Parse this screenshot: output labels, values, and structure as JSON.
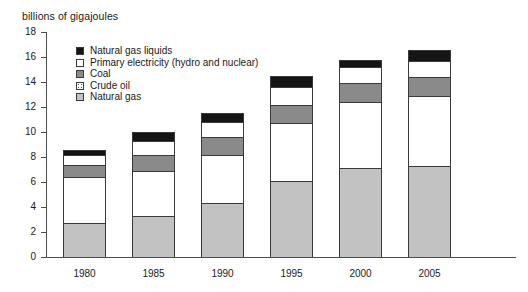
{
  "chart_data": {
    "type": "bar",
    "title": "",
    "subtitle": "",
    "ylabel": "billions of gigajoules",
    "xlabel": "",
    "ylim": [
      0,
      18
    ],
    "ytick_step": 2,
    "yticks": [
      "0",
      "2",
      "4",
      "6",
      "8",
      "10",
      "12",
      "14",
      "16",
      "18"
    ],
    "grid": false,
    "stacked": true,
    "legend_position": "inside-top-left",
    "categories": [
      "1980",
      "1985",
      "1990",
      "1995",
      "2000",
      "2005"
    ],
    "series": [
      {
        "name": "Natural gas",
        "key": "natural-gas",
        "color": "#c2c2c2",
        "swatch": "light-gray",
        "values": [
          2.7,
          3.3,
          4.3,
          6.1,
          7.1,
          7.3
        ]
      },
      {
        "name": "Crude oil",
        "key": "crude-oil",
        "color": "#ffffff",
        "swatch": "dotted-white",
        "values": [
          3.7,
          3.6,
          3.9,
          4.6,
          5.3,
          5.6
        ]
      },
      {
        "name": "Coal",
        "key": "coal",
        "color": "#8a8a8a",
        "swatch": "dark-gray",
        "values": [
          1.0,
          1.3,
          1.4,
          1.5,
          1.5,
          1.5
        ]
      },
      {
        "name": "Primary electricity (hydro and nuclear)",
        "key": "primary-electricity",
        "color": "#ffffff",
        "swatch": "white",
        "values": [
          0.8,
          1.1,
          1.2,
          1.4,
          1.3,
          1.3
        ]
      },
      {
        "name": "Natural gas liquids",
        "key": "natural-gas-liquids",
        "color": "#151515",
        "swatch": "black",
        "values": [
          0.4,
          0.7,
          0.7,
          0.9,
          0.6,
          0.9
        ]
      }
    ],
    "totals": [
      8.6,
      10.0,
      11.5,
      14.5,
      15.8,
      16.6
    ]
  },
  "legend": {
    "items": [
      {
        "label": "Natural gas liquids",
        "swatch": "black"
      },
      {
        "label": "Primary electricity (hydro and nuclear)",
        "swatch": "white"
      },
      {
        "label": "Coal",
        "swatch": "dark-gray"
      },
      {
        "label": "Crude oil",
        "swatch": "dotted-white"
      },
      {
        "label": "Natural gas",
        "swatch": "light-gray"
      }
    ]
  },
  "axis": {
    "y_title": "billions of gigajoules",
    "y_ticks": [
      "18",
      "16",
      "14",
      "12",
      "10",
      "8",
      "6",
      "4",
      "2",
      "0"
    ],
    "x_ticks": [
      "1980",
      "1985",
      "1990",
      "1995",
      "2000",
      "2005"
    ]
  },
  "colors": {
    "natural_gas": "#c2c2c2",
    "crude_oil": "#ffffff",
    "coal": "#8a8a8a",
    "primary_electricity": "#ffffff",
    "natural_gas_liquids": "#151515",
    "axis": "#4d4d4d",
    "outline": "#3a3a3a"
  }
}
